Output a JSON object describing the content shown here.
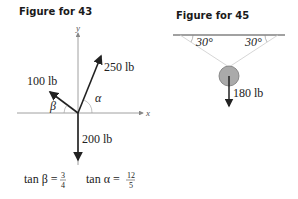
{
  "figures": [
    {
      "title": "Figure for 43",
      "axes": {
        "x_label": "x",
        "y_label": "y"
      },
      "forces": [
        {
          "label": "250 lb",
          "angle_label": "α"
        },
        {
          "label": "100 lb",
          "angle_label": "β"
        },
        {
          "label": "200 lb"
        }
      ],
      "equations": {
        "tan_beta": {
          "lhs": "tan β =",
          "num": "3",
          "den": "4"
        },
        "tan_alpha": {
          "lhs": "tan α =",
          "num": "12",
          "den": "5"
        }
      }
    },
    {
      "title": "Figure for 45",
      "angles": [
        "30°",
        "30°"
      ],
      "weight": "180 lb"
    }
  ],
  "colors": {
    "ink": "#222222",
    "axis": "#888888",
    "rope": "#cccccc",
    "ball": "#aaaaaa"
  }
}
